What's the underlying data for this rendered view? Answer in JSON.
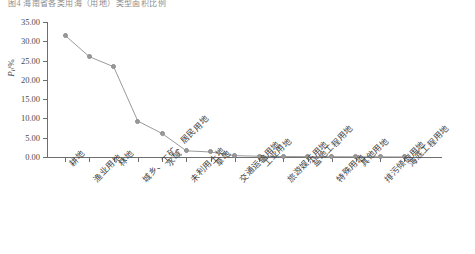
{
  "top_caption": "图4 海南省各类用海（用地）类型面积比例",
  "axes": {
    "y_title_main": "P",
    "y_title_sub": "i",
    "y_title_unit": "/%",
    "y_ticks": [
      "0.00",
      "5.00",
      "10.00",
      "15.00",
      "20.00",
      "25.00",
      "30.00",
      "35.00"
    ],
    "y_min": 0,
    "y_max": 35,
    "y_step": 5
  },
  "style": {
    "line_color": "#9a9a9a",
    "marker_color": "#9a9a9a",
    "axis_color": "#6e6e6e",
    "text_color": "#3f3f3f",
    "background": "#ffffff"
  },
  "chart_data": {
    "type": "line",
    "title": "",
    "xlabel": "",
    "ylabel": "P_i/%",
    "ylim": [
      0,
      35
    ],
    "grid": false,
    "legend": "none",
    "categories": [
      "耕地",
      "渔业用地",
      "林地",
      "城乡、工矿、居民用地",
      "水域",
      "未利用土地",
      "草地",
      "交通运输用地",
      "工业用地",
      "旅游娱乐用地",
      "盐地工程用地",
      "特殊用地",
      "其他用地",
      "排污倾倒用地",
      "海底工程用地"
    ],
    "values": [
      31.5,
      26.0,
      23.4,
      9.3,
      6.1,
      1.6,
      1.3,
      0.35,
      0.2,
      0.12,
      0.1,
      0.08,
      0.06,
      0.04,
      0.02
    ],
    "series": [
      {
        "name": "面积比例",
        "values": [
          31.5,
          26.0,
          23.4,
          9.3,
          6.1,
          1.6,
          1.3,
          0.35,
          0.2,
          0.12,
          0.1,
          0.08,
          0.06,
          0.04,
          0.02
        ]
      }
    ]
  }
}
